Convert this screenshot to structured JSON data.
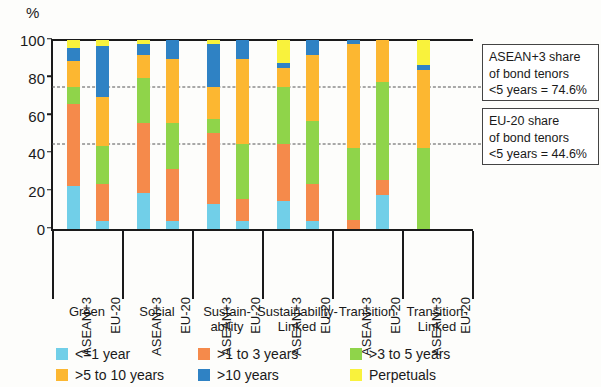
{
  "chart_data": {
    "type": "bar",
    "stacked": true,
    "title": "",
    "xlabel": "",
    "ylabel": "%",
    "ylim": [
      0,
      100
    ],
    "yticks": [
      0,
      20,
      40,
      60,
      80,
      100
    ],
    "grid": false,
    "legend_position": "bottom",
    "series": [
      {
        "name": "<=1 year",
        "color": "#71cfe8"
      },
      {
        "name": ">1 to 3 years",
        "color": "#f58a4b"
      },
      {
        "name": ">3 to 5 years",
        "color": "#8fd44a"
      },
      {
        "name": ">5 to 10 years",
        "color": "#fcb731"
      },
      {
        "name": ">10 years",
        "color": "#2f82c4"
      },
      {
        "name": "Perpetuals",
        "color": "#f9f23c"
      }
    ],
    "groups": [
      {
        "label": "Green",
        "bars": [
          {
            "category": "ASEAN+3",
            "values": [
              23,
              43,
              9,
              14,
              7,
              4
            ]
          },
          {
            "category": "EU-20",
            "values": [
              4,
              20,
              20,
              26,
              27,
              3
            ]
          }
        ]
      },
      {
        "label": "Social",
        "bars": [
          {
            "category": "ASEAN+3",
            "values": [
              19,
              37,
              24,
              12,
              6,
              2
            ]
          },
          {
            "category": "EU-20",
            "values": [
              4,
              28,
              24,
              34,
              10,
              0
            ]
          }
        ]
      },
      {
        "label": "Sustain-\nability",
        "bars": [
          {
            "category": "ASEAN+3",
            "values": [
              13,
              38,
              7,
              17,
              23,
              2
            ]
          },
          {
            "category": "EU-20",
            "values": [
              4,
              12,
              29,
              45,
              10,
              0
            ]
          }
        ]
      },
      {
        "label": "Sustainability-\nLinked",
        "bars": [
          {
            "category": "ASEAN+3",
            "values": [
              15,
              30,
              30,
              10,
              3,
              12
            ]
          },
          {
            "category": "EU-20",
            "values": [
              4,
              20,
              33,
              35,
              8,
              0
            ]
          }
        ]
      },
      {
        "label": "Transition",
        "bars": [
          {
            "category": "ASEAN+3",
            "values": [
              0,
              5,
              38,
              55,
              2,
              0
            ]
          },
          {
            "category": "EU-20",
            "values": [
              18,
              8,
              52,
              22,
              0,
              0
            ]
          }
        ]
      },
      {
        "label": "Transition-\nLinked",
        "bars": [
          {
            "category": "ASEAN+3",
            "values": [
              0,
              0,
              43,
              41,
              3,
              13
            ]
          },
          {
            "category": "EU-20",
            "values": [
              0,
              0,
              0,
              0,
              0,
              0
            ]
          }
        ]
      }
    ],
    "reference_lines": [
      {
        "value": 74.6,
        "label": "ASEAN+3 share of bond tenors <5 years = 74.6%"
      },
      {
        "value": 44.6,
        "label": "EU-20 share of bond tenors <5 years = 44.6%"
      }
    ]
  },
  "annotations": [
    {
      "line1": "ASEAN+3 share",
      "line2": "of bond tenors",
      "line3": "<5 years = 74.6%"
    },
    {
      "line1": "EU-20 share",
      "line2": "of bond tenors",
      "line3": "<5 years = 44.6%"
    }
  ]
}
